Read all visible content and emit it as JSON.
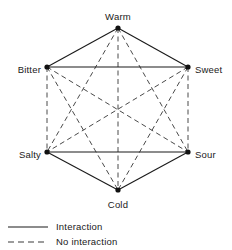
{
  "figure": {
    "type": "interaction-hexagon-diagram",
    "background_color": "#ffffff",
    "line_color": "#1a1a1a",
    "dash_color": "#4a4a4a"
  },
  "nodes": [
    {
      "id": "warm",
      "label": "Warm",
      "x": 118,
      "y": 28,
      "label_x": 118,
      "label_y": 17,
      "label_anchor": "middle"
    },
    {
      "id": "bitter",
      "label": "Bitter",
      "x": 47,
      "y": 67,
      "label_x": 41,
      "label_y": 70,
      "label_anchor": "end"
    },
    {
      "id": "sweet",
      "label": "Sweet",
      "x": 188,
      "y": 67,
      "label_x": 195,
      "label_y": 70,
      "label_anchor": "start"
    },
    {
      "id": "salty",
      "label": "Salty",
      "x": 47,
      "y": 152,
      "label_x": 41,
      "label_y": 155,
      "label_anchor": "end"
    },
    {
      "id": "sour",
      "label": "Sour",
      "x": 188,
      "y": 152,
      "label_x": 195,
      "label_y": 155,
      "label_anchor": "start"
    },
    {
      "id": "cold",
      "label": "Cold",
      "x": 118,
      "y": 190,
      "label_x": 118,
      "label_y": 205,
      "label_anchor": "middle"
    }
  ],
  "edges": [
    {
      "from": "warm",
      "to": "bitter",
      "style": "solid",
      "meaning": "Interaction"
    },
    {
      "from": "warm",
      "to": "sweet",
      "style": "solid",
      "meaning": "Interaction"
    },
    {
      "from": "bitter",
      "to": "sweet",
      "style": "solid",
      "meaning": "Interaction"
    },
    {
      "from": "salty",
      "to": "sour",
      "style": "solid",
      "meaning": "Interaction"
    },
    {
      "from": "salty",
      "to": "cold",
      "style": "solid",
      "meaning": "Interaction"
    },
    {
      "from": "sour",
      "to": "cold",
      "style": "solid",
      "meaning": "Interaction"
    },
    {
      "from": "warm",
      "to": "cold",
      "style": "dashed",
      "meaning": "No interaction"
    },
    {
      "from": "bitter",
      "to": "salty",
      "style": "dashed",
      "meaning": "No interaction"
    },
    {
      "from": "sweet",
      "to": "sour",
      "style": "dashed",
      "meaning": "No interaction"
    },
    {
      "from": "warm",
      "to": "salty",
      "style": "dashed",
      "meaning": "No interaction"
    },
    {
      "from": "warm",
      "to": "sour",
      "style": "dashed",
      "meaning": "No interaction"
    },
    {
      "from": "bitter",
      "to": "sour",
      "style": "dashed",
      "meaning": "No interaction"
    },
    {
      "from": "bitter",
      "to": "cold",
      "style": "dashed",
      "meaning": "No interaction"
    },
    {
      "from": "sweet",
      "to": "salty",
      "style": "dashed",
      "meaning": "No interaction"
    },
    {
      "from": "sweet",
      "to": "cold",
      "style": "dashed",
      "meaning": "No interaction"
    }
  ],
  "legend": {
    "items": [
      {
        "id": "interaction",
        "label": "Interaction",
        "style": "solid",
        "line_x1": 8,
        "line_x2": 48,
        "y": 227,
        "text_x": 56
      },
      {
        "id": "no-interaction",
        "label": "No interaction",
        "style": "dashed",
        "line_x1": 8,
        "line_x2": 48,
        "y": 242,
        "text_x": 56
      }
    ]
  },
  "chart_data": {
    "type": "diagram",
    "title": "",
    "nodes": [
      "Warm",
      "Bitter",
      "Sweet",
      "Salty",
      "Sour",
      "Cold"
    ],
    "interaction_pairs": [
      [
        "Warm",
        "Bitter"
      ],
      [
        "Warm",
        "Sweet"
      ],
      [
        "Bitter",
        "Sweet"
      ],
      [
        "Salty",
        "Sour"
      ],
      [
        "Salty",
        "Cold"
      ],
      [
        "Sour",
        "Cold"
      ]
    ],
    "no_interaction_pairs": [
      [
        "Warm",
        "Cold"
      ],
      [
        "Bitter",
        "Salty"
      ],
      [
        "Sweet",
        "Sour"
      ],
      [
        "Warm",
        "Salty"
      ],
      [
        "Warm",
        "Sour"
      ],
      [
        "Bitter",
        "Sour"
      ],
      [
        "Bitter",
        "Cold"
      ],
      [
        "Sweet",
        "Salty"
      ],
      [
        "Sweet",
        "Cold"
      ]
    ],
    "legend": [
      "Interaction",
      "No interaction"
    ]
  }
}
